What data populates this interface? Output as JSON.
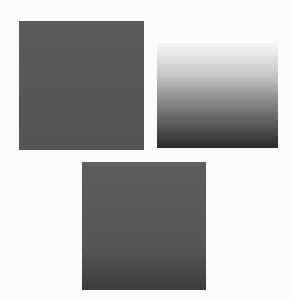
{
  "figure": {
    "background": "#fbfbfb",
    "squares": [
      {
        "name": "top-left-square",
        "fill": "flat dark gray",
        "color": "#575757"
      },
      {
        "name": "top-right-square",
        "fill": "vertical gradient light to dark",
        "color_top": "#f6f6f6",
        "color_bottom": "#2a2a2a"
      },
      {
        "name": "bottom-square",
        "fill": "dark gray, slightly darker at bottom",
        "color": "#555555"
      }
    ]
  }
}
